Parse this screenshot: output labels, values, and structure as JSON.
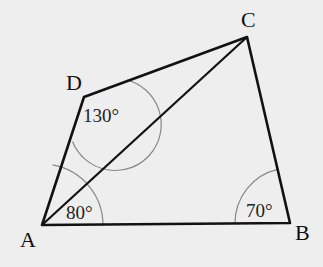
{
  "diagram": {
    "type": "quadrilateral",
    "vertices": [
      {
        "id": "A",
        "label": "A",
        "x": 42,
        "y": 225
      },
      {
        "id": "B",
        "label": "B",
        "x": 290,
        "y": 223
      },
      {
        "id": "C",
        "label": "C",
        "x": 247,
        "y": 37
      },
      {
        "id": "D",
        "label": "D",
        "x": 84,
        "y": 97
      }
    ],
    "edges": [
      "AB",
      "BC",
      "CD",
      "DA"
    ],
    "diagonals": [
      "AC"
    ],
    "angles": [
      {
        "vertex": "A",
        "label": "80°",
        "value": 80
      },
      {
        "vertex": "B",
        "label": "70°",
        "value": 70
      },
      {
        "vertex": "D",
        "label": "130°",
        "value": 130
      }
    ]
  },
  "labels": {
    "A": "A",
    "B": "B",
    "C": "C",
    "D": "D",
    "angle_A": "80°",
    "angle_B": "70°",
    "angle_D": "130°"
  }
}
